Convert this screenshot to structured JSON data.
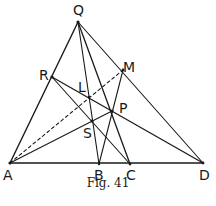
{
  "figure": {
    "caption": "Fig. 41",
    "stroke_color": "#1a1a1a",
    "background": "#ffffff"
  },
  "points": {
    "Q": {
      "label": "Q",
      "x": 78,
      "y": 22
    },
    "R": {
      "label": "R",
      "x": 52,
      "y": 77
    },
    "M": {
      "label": "M",
      "x": 123,
      "y": 70
    },
    "L": {
      "label": "L",
      "x": 89,
      "y": 97
    },
    "P": {
      "label": "P",
      "x": 112,
      "y": 111
    },
    "S": {
      "label": "S",
      "x": 92,
      "y": 121
    },
    "A": {
      "label": "A",
      "x": 10,
      "y": 163
    },
    "B": {
      "label": "B",
      "x": 99,
      "y": 164
    },
    "C": {
      "label": "C",
      "x": 130,
      "y": 164
    },
    "D": {
      "label": "D",
      "x": 203,
      "y": 163
    }
  },
  "segments": [
    {
      "from": "A",
      "to": "D",
      "style": "solid"
    },
    {
      "from": "A",
      "to": "Q",
      "style": "solid"
    },
    {
      "from": "Q",
      "to": "D",
      "style": "solid"
    },
    {
      "from": "Q",
      "to": "B",
      "style": "solid"
    },
    {
      "from": "Q",
      "to": "C",
      "style": "solid"
    },
    {
      "from": "R",
      "to": "D",
      "style": "solid"
    },
    {
      "from": "R",
      "to": "C",
      "style": "solid"
    },
    {
      "from": "A",
      "to": "P",
      "style": "solid"
    },
    {
      "from": "B",
      "to": "M",
      "style": "solid"
    },
    {
      "from": "A",
      "to": "M",
      "style": "dashed"
    }
  ]
}
